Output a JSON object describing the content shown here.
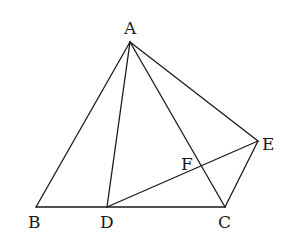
{
  "diagram": {
    "type": "geometry-figure",
    "points": [
      {
        "id": "A",
        "label": "A",
        "x": 130,
        "y": 42,
        "label_x": 124,
        "label_y": 34
      },
      {
        "id": "B",
        "label": "B",
        "x": 36,
        "y": 207,
        "label_x": 28,
        "label_y": 228
      },
      {
        "id": "D",
        "label": "D",
        "x": 107,
        "y": 207,
        "label_x": 100,
        "label_y": 228
      },
      {
        "id": "C",
        "label": "C",
        "x": 225,
        "y": 207,
        "label_x": 218,
        "label_y": 228
      },
      {
        "id": "E",
        "label": "E",
        "x": 258,
        "y": 141,
        "label_x": 262,
        "label_y": 150
      },
      {
        "id": "F",
        "label": "F",
        "x": 200,
        "y": 167,
        "label_x": 181,
        "label_y": 170
      }
    ],
    "segments": [
      [
        "A",
        "B"
      ],
      [
        "A",
        "D"
      ],
      [
        "A",
        "C"
      ],
      [
        "A",
        "E"
      ],
      [
        "B",
        "C"
      ],
      [
        "D",
        "E"
      ],
      [
        "C",
        "E"
      ]
    ],
    "stroke_color": "#1a1a1a",
    "background": "#ffffff"
  }
}
